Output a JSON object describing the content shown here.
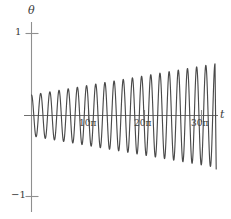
{
  "chart_data": {
    "type": "line",
    "title": "",
    "xlabel": "t",
    "ylabel": "θ",
    "xlim": [
      0,
      34.5
    ],
    "ylim": [
      -1,
      1
    ],
    "grid": false,
    "legend": null,
    "axis_labels": {
      "y_axis": "θ",
      "x_axis": "t"
    },
    "y_ticks": [
      {
        "value": 1,
        "label": "1"
      },
      {
        "value": -1,
        "label": "−1"
      }
    ],
    "x_ticks": [
      {
        "value": 31.4159,
        "label": "10π"
      },
      {
        "value": 62.8319,
        "label": "20π"
      },
      {
        "value": 94.2478,
        "label": "30π"
      }
    ],
    "x_tick_units": "pi_multiples",
    "series": [
      {
        "name": "theta(t)",
        "color": "#4a4a4a",
        "envelope_start": 0.25,
        "envelope_end": 0.63,
        "cycles_visible": 20,
        "x": [
          0,
          5,
          10,
          15,
          20,
          25,
          30,
          35,
          40,
          45,
          50,
          55,
          60,
          65,
          70,
          75,
          80,
          85,
          90,
          95,
          100,
          105
        ],
        "envelope": [
          0.25,
          0.27,
          0.29,
          0.31,
          0.33,
          0.35,
          0.37,
          0.39,
          0.41,
          0.43,
          0.45,
          0.47,
          0.49,
          0.51,
          0.53,
          0.55,
          0.57,
          0.59,
          0.61,
          0.63,
          0.65,
          0.67
        ]
      }
    ],
    "colors": {
      "curve": "#4a4a4a",
      "axis": "#8a8a8a",
      "text": "#3a3a3a",
      "background": "#ffffff"
    }
  },
  "figure": {
    "theta_label": "θ",
    "t_label": "t",
    "ytick_pos_one": "1",
    "ytick_neg_one": "−1",
    "xtick_ten_pi": "10π",
    "xtick_twenty_pi": "20π",
    "xtick_thirty_pi": "30π"
  }
}
